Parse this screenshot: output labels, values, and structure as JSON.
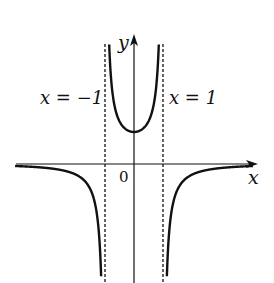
{
  "chart_data": {
    "type": "line",
    "title": "",
    "function": "y = 1/(1 - x^2)",
    "xlabel": "x",
    "ylabel": "y",
    "origin_label": "0",
    "asymptotes": [
      {
        "x": -1,
        "label": "x=−1"
      },
      {
        "x": 1,
        "label": "x=1"
      }
    ],
    "horizontal_asymptote": 0,
    "series": [
      {
        "name": "left branch",
        "domain": [
          -4.2,
          -1
        ],
        "behavior": "approaches 0 from below as x→−∞, →−∞ as x→−1⁻"
      },
      {
        "name": "middle branch",
        "domain": [
          -1,
          1
        ],
        "min_point": [
          0,
          1
        ],
        "behavior": "→+∞ as x→±1"
      },
      {
        "name": "right branch",
        "domain": [
          1,
          4.2
        ],
        "behavior": "→−∞ as x→1⁺, approaches 0 from below as x→+∞"
      }
    ],
    "grid": false,
    "legend": null,
    "ticks": []
  },
  "labels": {
    "x_axis": "x",
    "y_axis": "y",
    "origin": "0",
    "left_asymptote": "x = −1",
    "right_asymptote": "x = 1"
  }
}
